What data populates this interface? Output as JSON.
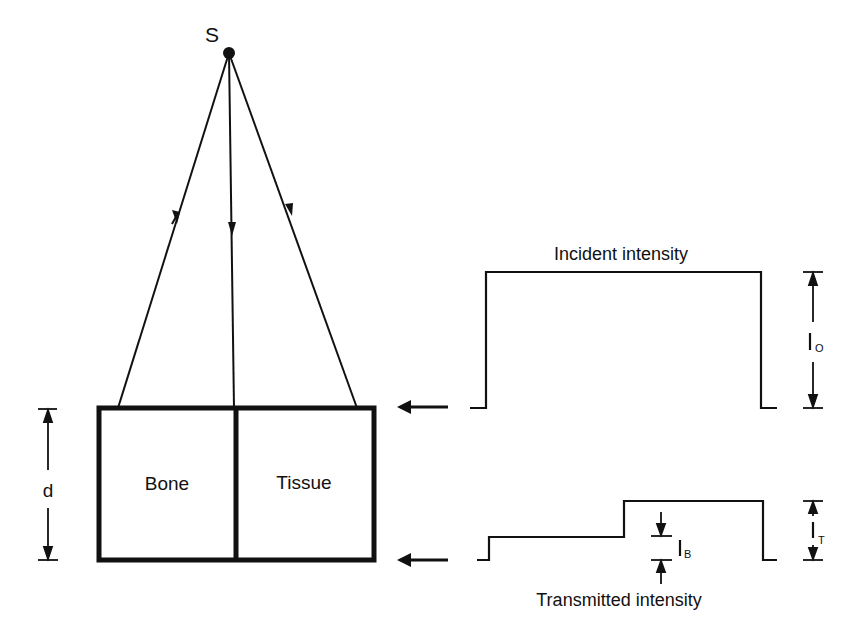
{
  "source": {
    "label": "S"
  },
  "slab": {
    "left_label": "Bone",
    "right_label": "Tissue",
    "thickness_label": "d"
  },
  "incident": {
    "title": "Incident intensity",
    "dim_label": "I",
    "dim_sub": "O"
  },
  "transmitted": {
    "title": "Transmitted intensity",
    "dim_label": "I",
    "dim_sub": "T",
    "bone_label": "I",
    "bone_sub": "B"
  }
}
